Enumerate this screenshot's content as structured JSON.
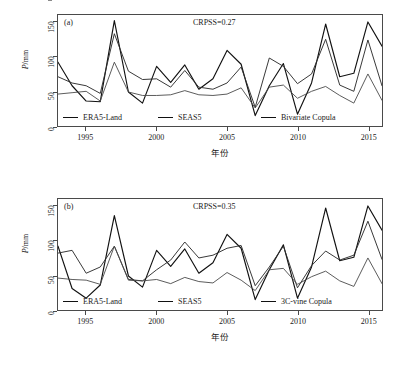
{
  "figure": {
    "panels": [
      "a",
      "b"
    ]
  },
  "axes": {
    "y_title_prefix": "P",
    "y_title_suffix": "/mm",
    "y_ticks": [
      0,
      50,
      100,
      150
    ],
    "y_tick_labels": [
      "0",
      "50",
      "100",
      "150"
    ],
    "x_title": "年份",
    "x_ticks": [
      1995,
      2000,
      2005,
      2010,
      2015
    ],
    "x_tick_labels": [
      "1995",
      "2000",
      "2005",
      "2010",
      "2015"
    ]
  },
  "panel_a": {
    "tag": "(a)",
    "crpss_text": "CRPSS=0.27",
    "legend": [
      {
        "label": "ERA5-Land",
        "color": "#111111"
      },
      {
        "label": "SEAS5",
        "color": "#333333"
      },
      {
        "label": "Bivariate Copula",
        "color": "#555555"
      }
    ]
  },
  "panel_b": {
    "tag": "(b)",
    "crpss_text": "CRPSS=0.35",
    "legend": [
      {
        "label": "ERA5-Land",
        "color": "#111111"
      },
      {
        "label": "SEAS5",
        "color": "#333333"
      },
      {
        "label": "3C-vine Copula",
        "color": "#555555"
      }
    ]
  },
  "chart_data": [
    {
      "type": "line",
      "panel": "a",
      "title": "(a) CRPSS=0.27",
      "xlabel": "年份",
      "ylabel": "P/mm",
      "xlim": [
        1993,
        2016
      ],
      "ylim": [
        0,
        160
      ],
      "ytick_values": [
        0,
        50,
        100,
        150
      ],
      "xtick_values": [
        1995,
        2000,
        2005,
        2010,
        2015
      ],
      "grid": false,
      "legend_position": "inside-bottom-left",
      "annotations": [
        {
          "text": "(a)",
          "x": 1993.3,
          "y": 155
        },
        {
          "text": "CRPSS=0.27",
          "x": 2002.5,
          "y": 155
        }
      ],
      "x": [
        1993,
        1994,
        1995,
        1996,
        1997,
        1998,
        1999,
        2000,
        2001,
        2002,
        2003,
        2004,
        2005,
        2006,
        2007,
        2008,
        2009,
        2010,
        2011,
        2012,
        2013,
        2014,
        2015,
        2016
      ],
      "series": [
        {
          "name": "ERA5-Land",
          "values": [
            92,
            58,
            36,
            35,
            152,
            49,
            33,
            86,
            63,
            88,
            53,
            68,
            109,
            89,
            15,
            58,
            90,
            17,
            62,
            147,
            71,
            76,
            150,
            115
          ]
        },
        {
          "name": "SEAS5",
          "values": [
            71,
            62,
            58,
            47,
            133,
            79,
            67,
            68,
            56,
            80,
            56,
            53,
            62,
            85,
            27,
            98,
            86,
            61,
            75,
            125,
            59,
            50,
            124,
            58
          ]
        },
        {
          "name": "Bivariate Copula",
          "values": [
            46,
            48,
            50,
            36,
            92,
            49,
            44,
            44,
            45,
            51,
            45,
            44,
            46,
            55,
            26,
            56,
            59,
            40,
            50,
            57,
            44,
            33,
            75,
            37
          ]
        }
      ]
    },
    {
      "type": "line",
      "panel": "b",
      "title": "(b) CRPSS=0.35",
      "xlabel": "年份",
      "ylabel": "P/mm",
      "xlim": [
        1993,
        2016
      ],
      "ylim": [
        0,
        160
      ],
      "ytick_values": [
        0,
        50,
        100,
        150
      ],
      "xtick_values": [
        1995,
        2000,
        2005,
        2010,
        2015
      ],
      "grid": false,
      "legend_position": "inside-bottom-left",
      "annotations": [
        {
          "text": "(b)",
          "x": 1993.3,
          "y": 155
        },
        {
          "text": "CRPSS=0.35",
          "x": 2002.5,
          "y": 155
        }
      ],
      "x": [
        1993,
        1994,
        1995,
        1996,
        1997,
        1998,
        1999,
        2000,
        2001,
        2002,
        2003,
        2004,
        2005,
        2006,
        2007,
        2008,
        2009,
        2010,
        2011,
        2012,
        2013,
        2014,
        2015,
        2016
      ],
      "series": [
        {
          "name": "ERA5-Land",
          "values": [
            92,
            31,
            17,
            36,
            136,
            49,
            33,
            86,
            63,
            88,
            53,
            68,
            109,
            89,
            15,
            58,
            94,
            17,
            62,
            147,
            71,
            76,
            150,
            115
          ]
        },
        {
          "name": "SEAS5",
          "values": [
            82,
            86,
            53,
            62,
            92,
            44,
            42,
            58,
            72,
            98,
            75,
            79,
            89,
            93,
            35,
            62,
            92,
            32,
            64,
            85,
            72,
            79,
            128,
            73
          ]
        },
        {
          "name": "3C-vine Copula",
          "values": [
            46,
            44,
            43,
            37,
            92,
            43,
            42,
            44,
            38,
            47,
            41,
            39,
            54,
            43,
            28,
            58,
            60,
            37,
            48,
            56,
            42,
            34,
            75,
            38
          ]
        }
      ]
    }
  ]
}
